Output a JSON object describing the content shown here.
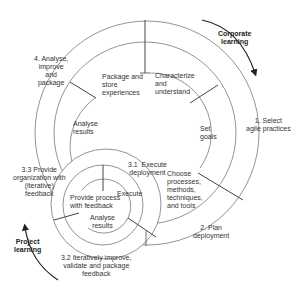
{
  "diagram": {
    "colors": {
      "line": "#777777",
      "divider": "#444444",
      "text": "#333333",
      "arrow": "#222222"
    },
    "outer_cycle": {
      "arrow_label": "Corporate\nlearning",
      "steps": [
        {
          "id": "1",
          "label": "1. Select\nagile practices"
        },
        {
          "id": "2",
          "label": "2. Plan\ndeployment"
        },
        {
          "id": "4",
          "label": "4. Analyse,\nimprove\nand\npackage"
        }
      ],
      "inner_steps": [
        {
          "label": "Characterize\nand\nunderstand"
        },
        {
          "label": "Set\ngoals"
        },
        {
          "label": "Choose\nprocesses,\nmethods,\ntechniques,\nand tools"
        },
        {
          "label": "Analyse\nresults"
        },
        {
          "label": "Package and\nstore\nexperiences"
        }
      ]
    },
    "project_cycle": {
      "arrow_label": "Project\nlearning",
      "steps": [
        {
          "id": "3.1",
          "label": "3.1  Execute\ndeployment"
        },
        {
          "id": "3.2",
          "label": "3.2 Iteratively improve,\nvalidate and package\nfeedback"
        },
        {
          "id": "3.3",
          "label": "3.3 Provide\norganization with\n(iterative)\nfeedback"
        }
      ],
      "inner_steps": [
        {
          "label": "Execute"
        },
        {
          "label": "Analyse\nresults"
        },
        {
          "label": "Provide process\nwith feedback"
        }
      ]
    }
  }
}
